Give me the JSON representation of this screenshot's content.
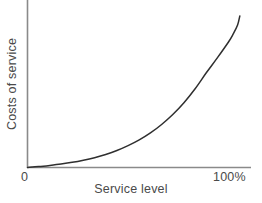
{
  "chart_data": {
    "type": "line",
    "title": "",
    "subtitle": "",
    "xlabel": "Service level",
    "ylabel": "Costs of service",
    "grid": false,
    "legend": false,
    "legend_position": "none",
    "annotations": [],
    "xlim": [
      0,
      100
    ],
    "ylim": [
      0,
      100
    ],
    "x_tick_labels": [
      "0",
      "100%"
    ],
    "x_tick_values": [
      0,
      100
    ],
    "y_tick_labels": [],
    "y_tick_values": [],
    "axis_color": "#8a8a8a",
    "curve_color": "#2f2f2f",
    "series": [
      {
        "name": "Costs of service",
        "x": [
          0,
          5,
          10,
          15,
          20,
          25,
          30,
          35,
          40,
          45,
          50,
          55,
          60,
          65,
          70,
          75,
          80,
          85,
          90,
          92,
          94,
          95
        ],
        "values": [
          0,
          0.6,
          1.4,
          2.3,
          3.4,
          4.8,
          6.5,
          8.6,
          11.2,
          14.4,
          18.2,
          22.8,
          28.4,
          35.0,
          42.8,
          52.0,
          62.5,
          72.5,
          83.0,
          88.0,
          94.0,
          100.0
        ]
      }
    ]
  },
  "axis_labels": {
    "x_title": "Service level",
    "y_title": "Costs of service",
    "x_tick_min": "0",
    "x_tick_max": "100%"
  }
}
